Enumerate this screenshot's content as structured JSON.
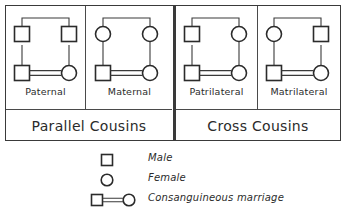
{
  "diagram": {
    "groups": [
      {
        "id": "parallel",
        "label": "Parallel Cousins",
        "cells": [
          {
            "id": "paternal",
            "label": "Paternal",
            "top_left_symbol": "square",
            "top_right_symbol": "square",
            "bottom_left_symbol": "square",
            "bottom_right_symbol": "circle",
            "marriage": "consanguineous"
          },
          {
            "id": "maternal",
            "label": "Maternal",
            "top_left_symbol": "circle",
            "top_right_symbol": "circle",
            "bottom_left_symbol": "square",
            "bottom_right_symbol": "circle",
            "marriage": "consanguineous"
          }
        ]
      },
      {
        "id": "cross",
        "label": "Cross Cousins",
        "cells": [
          {
            "id": "patrilateral",
            "label": "Patrilateral",
            "top_left_symbol": "square",
            "top_right_symbol": "circle",
            "bottom_left_symbol": "square",
            "bottom_right_symbol": "circle",
            "marriage": "consanguineous"
          },
          {
            "id": "matrilateral",
            "label": "Matrilateral",
            "top_left_symbol": "circle",
            "top_right_symbol": "square",
            "bottom_left_symbol": "square",
            "bottom_right_symbol": "circle",
            "marriage": "consanguineous"
          }
        ]
      }
    ]
  },
  "legend": {
    "items": [
      {
        "symbol": "square",
        "label": "Male"
      },
      {
        "symbol": "circle",
        "label": "Female"
      },
      {
        "symbol": "square-double-line-circle",
        "label": "Consanguineous marriage"
      }
    ]
  },
  "colors": {
    "stroke": "#2b2b2b",
    "line": "#3a3a3a",
    "background": "#ffffff"
  }
}
